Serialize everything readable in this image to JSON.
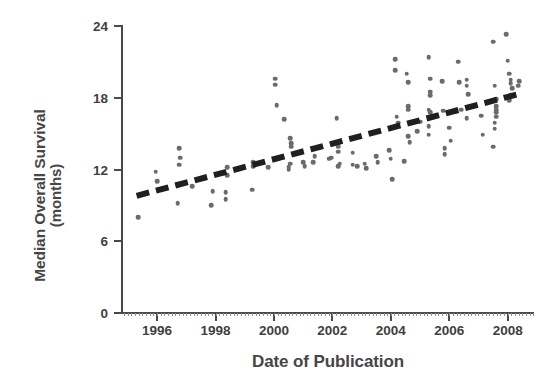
{
  "chart_data": {
    "type": "scatter",
    "title": "",
    "xlabel": "Date of Publication",
    "ylabel_line1": "Median Overall Survival",
    "ylabel_line2": "(months)",
    "xlim": [
      1994.8,
      2008.9
    ],
    "ylim": [
      0,
      24
    ],
    "xticks": [
      1996,
      1998,
      2000,
      2002,
      2004,
      2006,
      2008
    ],
    "xtick_labels": [
      "1996",
      "1998",
      "2000",
      "2002",
      "2004",
      "2006",
      "2008"
    ],
    "yticks": [
      0,
      6,
      12,
      18,
      24
    ],
    "ytick_labels": [
      "0",
      "6",
      "12",
      "18",
      "24"
    ],
    "grid": false,
    "legend": "none",
    "point_color": "#6b6b6b",
    "line_color": "#1f1f1f",
    "axis_color": "#4a4a4a",
    "background": "#ffffff",
    "trendline": {
      "style": "dashed",
      "label": "",
      "x": [
        1995.3,
        2008.5
      ],
      "y": [
        9.8,
        18.4
      ]
    },
    "series": [
      {
        "name": "Clinical trials",
        "marker": "circle",
        "points": [
          [
            1995.35,
            8.0
          ],
          [
            1995.95,
            11.8
          ],
          [
            1996.0,
            11.0
          ],
          [
            1996.75,
            13.8
          ],
          [
            1996.8,
            13.0
          ],
          [
            1996.75,
            12.4
          ],
          [
            1996.7,
            9.2
          ],
          [
            1997.9,
            10.2
          ],
          [
            1997.85,
            9.0
          ],
          [
            1998.4,
            12.2
          ],
          [
            1998.4,
            11.5
          ],
          [
            1998.35,
            10.1
          ],
          [
            1998.35,
            9.5
          ],
          [
            1999.3,
            12.6
          ],
          [
            1999.3,
            12.3
          ],
          [
            1999.25,
            10.3
          ],
          [
            2000.05,
            19.6
          ],
          [
            2000.05,
            19.1
          ],
          [
            2000.1,
            17.4
          ],
          [
            2000.35,
            16.2
          ],
          [
            2000.55,
            14.6
          ],
          [
            2000.6,
            14.2
          ],
          [
            2000.6,
            13.9
          ],
          [
            2000.55,
            12.5
          ],
          [
            2000.5,
            12.2
          ],
          [
            2000.5,
            12.0
          ],
          [
            2001.35,
            12.6
          ],
          [
            2001.4,
            13.1
          ],
          [
            2001.9,
            12.9
          ],
          [
            2001.95,
            13.0
          ],
          [
            2002.15,
            16.3
          ],
          [
            2002.2,
            14.2
          ],
          [
            2002.2,
            13.9
          ],
          [
            2002.2,
            13.5
          ],
          [
            2002.25,
            12.5
          ],
          [
            2002.2,
            12.3
          ],
          [
            2002.7,
            13.4
          ],
          [
            2002.7,
            12.4
          ],
          [
            2003.95,
            13.6
          ],
          [
            2004.0,
            12.9
          ],
          [
            2004.05,
            11.2
          ],
          [
            2004.15,
            21.2
          ],
          [
            2004.15,
            20.3
          ],
          [
            2004.2,
            16.4
          ],
          [
            2004.25,
            15.9
          ],
          [
            2004.45,
            12.7
          ],
          [
            2004.55,
            20.0
          ],
          [
            2004.6,
            19.3
          ],
          [
            2004.6,
            17.3
          ],
          [
            2004.6,
            17.0
          ],
          [
            2004.6,
            14.8
          ],
          [
            2004.65,
            14.3
          ],
          [
            2005.3,
            21.4
          ],
          [
            2005.35,
            19.6
          ],
          [
            2005.35,
            18.5
          ],
          [
            2005.35,
            18.2
          ],
          [
            2005.3,
            17.0
          ],
          [
            2005.35,
            16.8
          ],
          [
            2005.3,
            15.6
          ],
          [
            2005.3,
            14.9
          ],
          [
            2005.75,
            19.4
          ],
          [
            2005.8,
            16.9
          ],
          [
            2005.85,
            13.8
          ],
          [
            2005.85,
            13.3
          ],
          [
            2006.3,
            21.0
          ],
          [
            2006.35,
            19.3
          ],
          [
            2006.4,
            17.0
          ],
          [
            2006.6,
            19.5
          ],
          [
            2006.6,
            19.0
          ],
          [
            2006.65,
            18.3
          ],
          [
            2006.6,
            16.3
          ],
          [
            2007.5,
            22.7
          ],
          [
            2007.55,
            19.0
          ],
          [
            2007.6,
            17.9
          ],
          [
            2007.6,
            17.3
          ],
          [
            2007.6,
            17.0
          ],
          [
            2007.6,
            16.8
          ],
          [
            2007.6,
            16.4
          ],
          [
            2007.55,
            15.9
          ],
          [
            2007.55,
            15.4
          ],
          [
            2007.5,
            13.9
          ],
          [
            2007.95,
            23.3
          ],
          [
            2008.0,
            21.1
          ],
          [
            2008.05,
            20.0
          ],
          [
            2008.1,
            19.5
          ],
          [
            2008.1,
            19.2
          ],
          [
            2008.15,
            18.8
          ],
          [
            2008.1,
            18.2
          ],
          [
            2008.05,
            17.8
          ],
          [
            2003.1,
            12.5
          ],
          [
            2003.15,
            12.1
          ],
          [
            2001.0,
            12.6
          ],
          [
            2001.05,
            12.3
          ],
          [
            2006.0,
            15.5
          ],
          [
            2006.05,
            14.4
          ],
          [
            2004.9,
            15.2
          ],
          [
            2007.1,
            16.5
          ],
          [
            2007.15,
            14.9
          ],
          [
            2005.0,
            16.0
          ],
          [
            2002.85,
            12.3
          ],
          [
            1999.8,
            12.2
          ],
          [
            1997.2,
            10.6
          ],
          [
            2008.4,
            19.4
          ],
          [
            2008.35,
            19.0
          ],
          [
            2003.5,
            13.1
          ],
          [
            2003.55,
            12.6
          ]
        ]
      }
    ]
  }
}
